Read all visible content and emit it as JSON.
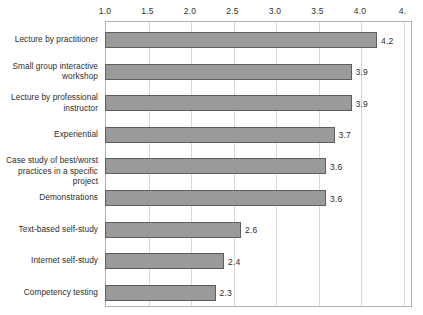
{
  "chart_data": {
    "type": "bar",
    "orientation": "horizontal",
    "title": "",
    "xlabel": "",
    "ylabel": "",
    "xlim": [
      1.0,
      4.5
    ],
    "xticks": [
      "1.0",
      "1.5",
      "2.0",
      "2.5",
      "3.0",
      "3.5",
      "4.0",
      "4."
    ],
    "xtick_values": [
      1.0,
      1.5,
      2.0,
      2.5,
      3.0,
      3.5,
      4.0,
      4.5
    ],
    "grid": "vertical",
    "legend": "none",
    "bar_color": "#9a9a9a",
    "bar_border_color": "#5d5d5d",
    "categories": [
      "Lecture by practitioner",
      "Small group interactive\nworkshop",
      "Lecture by professional\ninstructor",
      "Experiential",
      "Case study of best/worst\npractices in a specific project",
      "Demonstrations",
      "Text-based self-study",
      "Internet self-study",
      "Competency testing"
    ],
    "values": [
      4.2,
      3.9,
      3.9,
      3.7,
      3.6,
      3.6,
      2.6,
      2.4,
      2.3
    ],
    "value_labels": [
      "4.2",
      "3.9",
      "3.9",
      "3.7",
      "3.6",
      "3.6",
      "2.6",
      "2.4",
      "2.3"
    ]
  }
}
